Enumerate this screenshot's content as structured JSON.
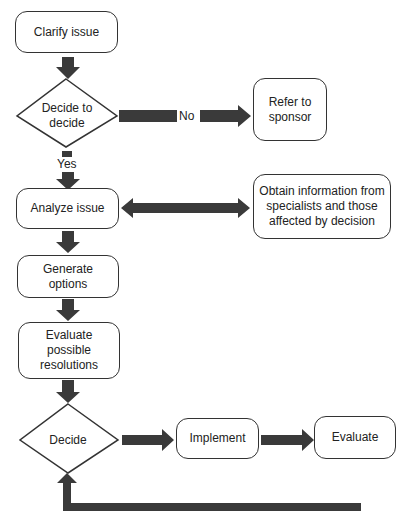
{
  "diagram": {
    "type": "flowchart",
    "colors": {
      "arrow": "#3a3a3a",
      "border": "#333333",
      "background": "#ffffff"
    },
    "nodes": {
      "clarify": {
        "label": "Clarify issue",
        "shape": "rounded-rect"
      },
      "decide_to_decide": {
        "label": "Decide to\ndecide",
        "shape": "diamond"
      },
      "refer": {
        "label": "Refer to\nsponsor",
        "shape": "rounded-rect"
      },
      "analyze": {
        "label": "Analyze issue",
        "shape": "rounded-rect"
      },
      "obtain": {
        "label": "Obtain information from\nspecialists and those\naffected by decision",
        "shape": "rounded-rect"
      },
      "generate": {
        "label": "Generate\noptions",
        "shape": "rounded-rect"
      },
      "evaluate_res": {
        "label": "Evaluate\npossible\nresolutions",
        "shape": "rounded-rect"
      },
      "decide": {
        "label": "Decide",
        "shape": "diamond"
      },
      "implement": {
        "label": "Implement",
        "shape": "rounded-rect"
      },
      "evaluate": {
        "label": "Evaluate",
        "shape": "rounded-rect"
      }
    },
    "edge_labels": {
      "no": "No",
      "yes": "Yes"
    },
    "edges": [
      {
        "from": "Clarify issue",
        "to": "Decide to decide"
      },
      {
        "from": "Decide to decide",
        "to": "Refer to sponsor",
        "label": "No"
      },
      {
        "from": "Decide to decide",
        "to": "Analyze issue",
        "label": "Yes"
      },
      {
        "from": "Analyze issue",
        "to": "Obtain information from specialists and those affected by decision",
        "bidirectional": true
      },
      {
        "from": "Analyze issue",
        "to": "Generate options"
      },
      {
        "from": "Generate options",
        "to": "Evaluate possible resolutions"
      },
      {
        "from": "Evaluate possible resolutions",
        "to": "Decide"
      },
      {
        "from": "Decide",
        "to": "Implement"
      },
      {
        "from": "Implement",
        "to": "Evaluate"
      },
      {
        "from": "Evaluate",
        "to": "Decide"
      }
    ]
  }
}
